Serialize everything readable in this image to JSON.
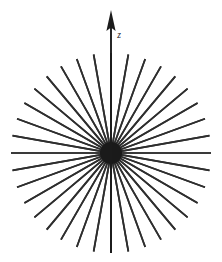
{
  "figure": {
    "background_color": "#ffffff",
    "width": 222,
    "height": 262
  },
  "axis": {
    "label": "z",
    "direction": "up",
    "arrow": "arrow-up",
    "color": "#1c1c1c",
    "tip_y": 11,
    "label_x": 119,
    "label_y": 38
  },
  "chart_data": {
    "type": "scatter",
    "xlabel": "",
    "ylabel": "",
    "center": {
      "x": 111,
      "y": 153
    },
    "radius": 100,
    "ray_count": 36,
    "angle_step_deg": 10,
    "start_angle_deg": 0,
    "line_color": "#2e2e2e",
    "line_width": 1.7,
    "hub_radius": 11,
    "hub_color": "#1a1a1a",
    "grid": false,
    "legend": "none",
    "angles_deg": [
      0,
      10,
      20,
      30,
      40,
      50,
      60,
      70,
      80,
      90,
      100,
      110,
      120,
      130,
      140,
      150,
      160,
      170,
      180,
      190,
      200,
      210,
      220,
      230,
      240,
      250,
      260,
      270,
      280,
      290,
      300,
      310,
      320,
      330,
      340,
      350
    ],
    "annotations": [
      {
        "text": "z",
        "x": 119,
        "y": 38,
        "style": "italic"
      }
    ]
  }
}
